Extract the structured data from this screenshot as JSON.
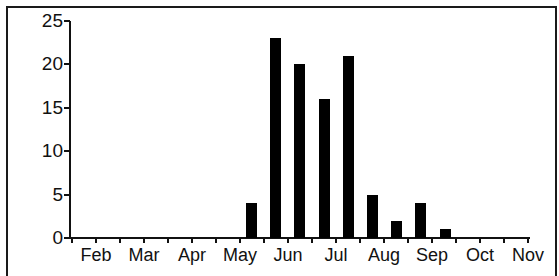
{
  "chart_data": {
    "type": "bar",
    "title": "",
    "xlabel": "",
    "ylabel": "",
    "ylim": [
      0,
      25
    ],
    "yticks": [
      "0",
      "5",
      "10",
      "15",
      "20",
      "25"
    ],
    "xtick_labels": [
      "Feb",
      "Mar",
      "Apr",
      "May",
      "Jun",
      "Jul",
      "Aug",
      "Sep",
      "Oct",
      "Nov"
    ],
    "categories": [
      "late May",
      "early Jun",
      "late Jun",
      "early Jul",
      "late Jul",
      "early Aug",
      "late Aug",
      "early Sep",
      "late Sep"
    ],
    "values": [
      4,
      23,
      20,
      16,
      21,
      5,
      2,
      4,
      1
    ],
    "grid": false,
    "legend": null,
    "bar_color": "#000000"
  }
}
